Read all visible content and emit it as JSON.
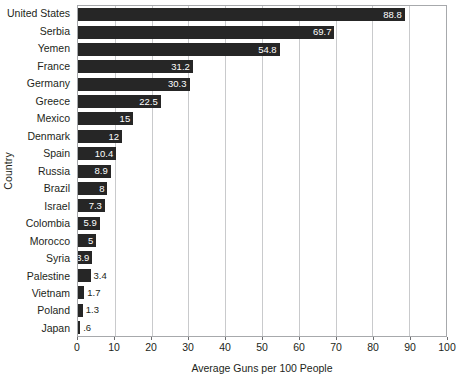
{
  "chart_data": {
    "type": "bar",
    "orientation": "horizontal",
    "title": "",
    "xlabel": "Average Guns per 100 People",
    "ylabel": "Country",
    "xlim": [
      0,
      100
    ],
    "xticks": [
      0,
      10,
      20,
      30,
      40,
      50,
      60,
      70,
      80,
      90,
      100
    ],
    "grid": "vertical",
    "legend": "none",
    "bar_color": "#262626",
    "gridline_color": "#c9cacc",
    "axis_color": "#a7a9ac",
    "categories": [
      "United States",
      "Serbia",
      "Yemen",
      "France",
      "Germany",
      "Greece",
      "Mexico",
      "Denmark",
      "Spain",
      "Russia",
      "Brazil",
      "Israel",
      "Colombia",
      "Morocco",
      "Syria",
      "Palestine",
      "Vietnam",
      "Poland",
      "Japan"
    ],
    "values": [
      88.8,
      69.7,
      54.8,
      31.2,
      30.3,
      22.5,
      15,
      12,
      10.4,
      8.9,
      8,
      7.3,
      5.9,
      5,
      3.9,
      3.4,
      1.7,
      1.3,
      0.6
    ],
    "value_labels": [
      "88.8",
      "69.7",
      "54.8",
      "31.2",
      "30.3",
      "22.5",
      "15",
      "12",
      "10.4",
      "8.9",
      "8",
      "7.3",
      "5.9",
      "5",
      "3.9",
      "3.4",
      "1.7",
      "1.3",
      ".6"
    ],
    "label_placement": [
      "inside",
      "inside",
      "inside",
      "inside",
      "inside",
      "inside",
      "inside",
      "inside",
      "inside",
      "inside",
      "inside",
      "inside",
      "inside",
      "inside",
      "inside",
      "outside",
      "outside",
      "outside",
      "outside"
    ],
    "bars": [
      {
        "category": "United States",
        "value": 88.8,
        "label": "88.8",
        "placement": "inside"
      },
      {
        "category": "Serbia",
        "value": 69.7,
        "label": "69.7",
        "placement": "inside"
      },
      {
        "category": "Yemen",
        "value": 54.8,
        "label": "54.8",
        "placement": "inside"
      },
      {
        "category": "France",
        "value": 31.2,
        "label": "31.2",
        "placement": "inside"
      },
      {
        "category": "Germany",
        "value": 30.3,
        "label": "30.3",
        "placement": "inside"
      },
      {
        "category": "Greece",
        "value": 22.5,
        "label": "22.5",
        "placement": "inside"
      },
      {
        "category": "Mexico",
        "value": 15,
        "label": "15",
        "placement": "inside"
      },
      {
        "category": "Denmark",
        "value": 12,
        "label": "12",
        "placement": "inside"
      },
      {
        "category": "Spain",
        "value": 10.4,
        "label": "10.4",
        "placement": "inside"
      },
      {
        "category": "Russia",
        "value": 8.9,
        "label": "8.9",
        "placement": "inside"
      },
      {
        "category": "Brazil",
        "value": 8,
        "label": "8",
        "placement": "inside"
      },
      {
        "category": "Israel",
        "value": 7.3,
        "label": "7.3",
        "placement": "inside"
      },
      {
        "category": "Colombia",
        "value": 5.9,
        "label": "5.9",
        "placement": "inside"
      },
      {
        "category": "Morocco",
        "value": 5,
        "label": "5",
        "placement": "inside"
      },
      {
        "category": "Syria",
        "value": 3.9,
        "label": "3.9",
        "placement": "inside"
      },
      {
        "category": "Palestine",
        "value": 3.4,
        "label": "3.4",
        "placement": "outside"
      },
      {
        "category": "Vietnam",
        "value": 1.7,
        "label": "1.7",
        "placement": "outside"
      },
      {
        "category": "Poland",
        "value": 1.3,
        "label": "1.3",
        "placement": "outside"
      },
      {
        "category": "Japan",
        "value": 0.6,
        "label": ".6",
        "placement": "outside"
      }
    ]
  }
}
